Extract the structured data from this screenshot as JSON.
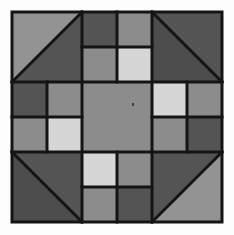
{
  "block": {
    "name": "Quilt block (churn-dash style, grayscale)",
    "x": 12,
    "y": 12,
    "size": 210,
    "grid": 3,
    "line_color": "#141414",
    "line_width": 3,
    "background": "#fdfdfd"
  },
  "colors": {
    "dark": "#545454",
    "darker": "#4d4d4d",
    "medium": "#8c8c8c",
    "medium_light": "#939393",
    "light": "#d6d6d6"
  },
  "corners": [
    {
      "position": "top-left",
      "diagonal": "bl-tr",
      "triangle_a": "medium_light",
      "triangle_b": "dark"
    },
    {
      "position": "top-right",
      "diagonal": "tl-br",
      "triangle_a": "dark",
      "triangle_b": "darker"
    },
    {
      "position": "bottom-left",
      "diagonal": "tl-br",
      "triangle_a": "dark",
      "triangle_b": "darker"
    },
    {
      "position": "bottom-right",
      "diagonal": "bl-tr",
      "triangle_a": "dark",
      "triangle_b": "medium_light"
    }
  ],
  "four_patches": [
    {
      "position": "top-middle",
      "cells": [
        "dark",
        "medium",
        "medium",
        "light"
      ]
    },
    {
      "position": "middle-left",
      "cells": [
        "dark",
        "medium",
        "medium",
        "light"
      ]
    },
    {
      "position": "middle-right",
      "cells": [
        "light",
        "medium",
        "medium",
        "dark"
      ]
    },
    {
      "position": "bottom-middle",
      "cells": [
        "light",
        "medium",
        "medium",
        "dark"
      ]
    }
  ],
  "center": {
    "color": "medium",
    "speck": {
      "x": 132,
      "y": 103
    }
  }
}
